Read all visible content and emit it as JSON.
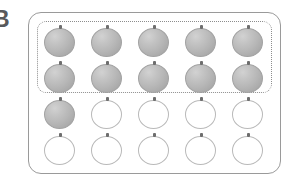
{
  "figure": {
    "label": "B",
    "caption_visible": false
  },
  "panel": {
    "shape": "rounded-rectangle",
    "border_color": "#9a9a9a",
    "background": "#ffffff"
  },
  "group_outline": {
    "style": "dotted",
    "color": "#8d8d8d",
    "encloses_rows": [
      1,
      2
    ],
    "encloses_count": 10
  },
  "legend": {
    "filled_color": "#b6b6b6",
    "empty_color": "#ffffff",
    "outline_color": "#b9b9b9",
    "stem_color": "#6e6e6e"
  },
  "counts": {
    "columns": 5,
    "rows": 4,
    "total": 20,
    "filled": 11,
    "empty": 9,
    "grouped": 10,
    "ungrouped_filled": 1
  },
  "grid": {
    "rows": [
      {
        "index": 1,
        "in_group": true,
        "cells": [
          {
            "state": "filled",
            "label": "filled-ball"
          },
          {
            "state": "filled",
            "label": "filled-ball"
          },
          {
            "state": "filled",
            "label": "filled-ball"
          },
          {
            "state": "filled",
            "label": "filled-ball"
          },
          {
            "state": "filled",
            "label": "filled-ball"
          }
        ]
      },
      {
        "index": 2,
        "in_group": true,
        "cells": [
          {
            "state": "filled",
            "label": "filled-ball"
          },
          {
            "state": "filled",
            "label": "filled-ball"
          },
          {
            "state": "filled",
            "label": "filled-ball"
          },
          {
            "state": "filled",
            "label": "filled-ball"
          },
          {
            "state": "filled",
            "label": "filled-ball"
          }
        ]
      },
      {
        "index": 3,
        "in_group": false,
        "cells": [
          {
            "state": "filled",
            "label": "filled-ball"
          },
          {
            "state": "empty",
            "label": "empty-ball"
          },
          {
            "state": "empty",
            "label": "empty-ball"
          },
          {
            "state": "empty",
            "label": "empty-ball"
          },
          {
            "state": "empty",
            "label": "empty-ball"
          }
        ]
      },
      {
        "index": 4,
        "in_group": false,
        "cells": [
          {
            "state": "empty",
            "label": "empty-ball"
          },
          {
            "state": "empty",
            "label": "empty-ball"
          },
          {
            "state": "empty",
            "label": "empty-ball"
          },
          {
            "state": "empty",
            "label": "empty-ball"
          },
          {
            "state": "empty",
            "label": "empty-ball"
          }
        ]
      }
    ]
  }
}
